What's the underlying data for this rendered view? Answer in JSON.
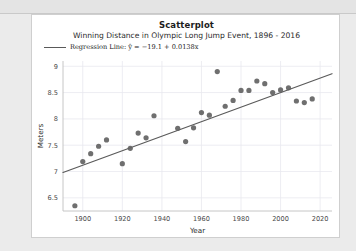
{
  "card": {
    "title": "Scatterplot",
    "subtitle": "Winning Distance in Olympic Long Jump Event, 1896 - 2016"
  },
  "legend": {
    "label": "Regression Line: ŷ = −19.1 + 0.0138x",
    "line_color": "#595959"
  },
  "style": {
    "point_color": "#636363",
    "line_color": "#5a5a5a",
    "grid_color": "#e8e8ef",
    "axis_color": "#bfbfbf",
    "card_bg": "#ffffff",
    "page_bg": "#ebebeb"
  },
  "chart_data": {
    "type": "scatter",
    "title": "Scatterplot",
    "subtitle": "Winning Distance in Olympic Long Jump Event, 1896 - 2016",
    "xlabel": "Year",
    "ylabel": "Meters",
    "xlim": [
      1890,
      2026
    ],
    "ylim": [
      6.25,
      9.1
    ],
    "xticks": [
      1900,
      1920,
      1940,
      1960,
      1980,
      2000,
      2020
    ],
    "xtick_labels": [
      "1900",
      "1920",
      "1940",
      "1960",
      "1980",
      "2000",
      "2020"
    ],
    "yticks": [
      6.5,
      7,
      7.5,
      8,
      8.5,
      9
    ],
    "ytick_labels": [
      "6.5",
      "7",
      "7.5",
      "8",
      "8.5",
      "9"
    ],
    "grid": true,
    "legend_position": "above-left",
    "x": [
      1896,
      1900,
      1904,
      1908,
      1912,
      1920,
      1924,
      1928,
      1932,
      1936,
      1948,
      1952,
      1956,
      1960,
      1964,
      1968,
      1972,
      1976,
      1980,
      1984,
      1988,
      1992,
      1996,
      2000,
      2004,
      2008,
      2012,
      2016
    ],
    "y": [
      6.35,
      7.19,
      7.34,
      7.48,
      7.6,
      7.15,
      7.44,
      7.73,
      7.64,
      8.06,
      7.82,
      7.57,
      7.83,
      8.12,
      8.07,
      8.9,
      8.24,
      8.35,
      8.54,
      8.54,
      8.72,
      8.67,
      8.5,
      8.55,
      8.59,
      8.34,
      8.31,
      8.38
    ],
    "series": [
      {
        "name": "Winning Distance",
        "points": [
          {
            "year": 1896,
            "meters": 6.35
          },
          {
            "year": 1900,
            "meters": 7.19
          },
          {
            "year": 1904,
            "meters": 7.34
          },
          {
            "year": 1908,
            "meters": 7.48
          },
          {
            "year": 1912,
            "meters": 7.6
          },
          {
            "year": 1920,
            "meters": 7.15
          },
          {
            "year": 1924,
            "meters": 7.44
          },
          {
            "year": 1928,
            "meters": 7.73
          },
          {
            "year": 1932,
            "meters": 7.64
          },
          {
            "year": 1936,
            "meters": 8.06
          },
          {
            "year": 1948,
            "meters": 7.82
          },
          {
            "year": 1952,
            "meters": 7.57
          },
          {
            "year": 1956,
            "meters": 7.83
          },
          {
            "year": 1960,
            "meters": 8.12
          },
          {
            "year": 1964,
            "meters": 8.07
          },
          {
            "year": 1968,
            "meters": 8.9
          },
          {
            "year": 1972,
            "meters": 8.24
          },
          {
            "year": 1976,
            "meters": 8.35
          },
          {
            "year": 1980,
            "meters": 8.54
          },
          {
            "year": 1984,
            "meters": 8.54
          },
          {
            "year": 1988,
            "meters": 8.72
          },
          {
            "year": 1992,
            "meters": 8.67
          },
          {
            "year": 1996,
            "meters": 8.5
          },
          {
            "year": 2000,
            "meters": 8.55
          },
          {
            "year": 2004,
            "meters": 8.59
          },
          {
            "year": 2008,
            "meters": 8.34
          },
          {
            "year": 2012,
            "meters": 8.31
          },
          {
            "year": 2016,
            "meters": 8.38
          }
        ]
      }
    ],
    "regression": {
      "label": "Regression Line: ŷ = −19.1 + 0.0138x",
      "intercept": -19.1,
      "slope": 0.0138
    }
  }
}
